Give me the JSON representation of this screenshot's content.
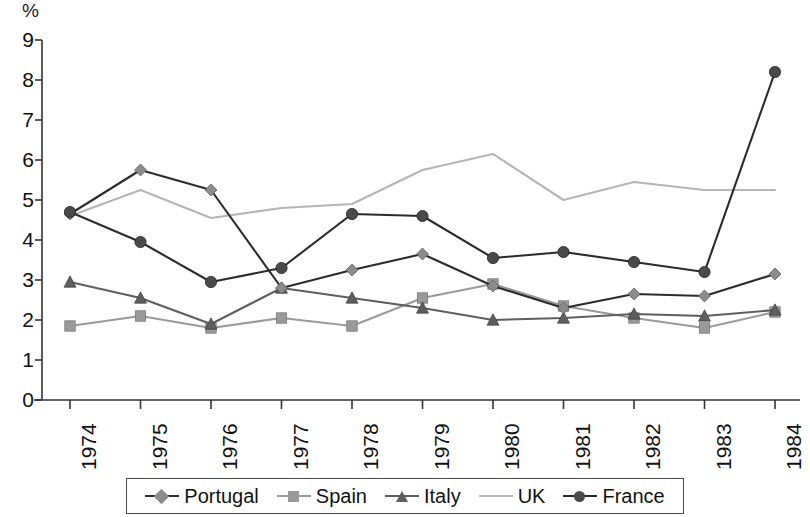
{
  "chart_data": {
    "type": "line",
    "title": "",
    "subtitle": "",
    "xlabel": "",
    "ylabel": "%",
    "unit_label": "%",
    "categories": [
      "1974",
      "1975",
      "1976",
      "1977",
      "1978",
      "1979",
      "1980",
      "1981",
      "1982",
      "1983",
      "1984"
    ],
    "x": [
      1974,
      1975,
      1976,
      1977,
      1978,
      1979,
      1980,
      1981,
      1982,
      1983,
      1984
    ],
    "ylim": [
      0,
      9
    ],
    "yticks": [
      0,
      1,
      2,
      3,
      4,
      5,
      6,
      7,
      8,
      9
    ],
    "ytick_labels": [
      "0",
      "1",
      "2",
      "3",
      "4",
      "5",
      "6",
      "7",
      "8",
      "9"
    ],
    "grid": false,
    "legend_position": "bottom",
    "series": [
      {
        "name": "Portugal",
        "marker": "diamond",
        "color": "#8c8c8c",
        "line_color": "#2b2b2b",
        "values": [
          4.65,
          5.75,
          5.25,
          2.8,
          3.25,
          3.65,
          2.85,
          2.3,
          2.65,
          2.6,
          3.15
        ]
      },
      {
        "name": "Spain",
        "marker": "square",
        "color": "#9a9a9a",
        "line_color": "#9a9a9a",
        "values": [
          1.85,
          2.1,
          1.8,
          2.05,
          1.85,
          2.55,
          2.9,
          2.35,
          2.05,
          1.8,
          2.2
        ]
      },
      {
        "name": "Italy",
        "marker": "triangle",
        "color": "#5e5e5e",
        "line_color": "#5e5e5e",
        "values": [
          2.95,
          2.55,
          1.9,
          2.8,
          2.55,
          2.3,
          2.0,
          2.05,
          2.15,
          2.1,
          2.25
        ]
      },
      {
        "name": "UK",
        "marker": "none",
        "color": "#b5b5b5",
        "line_color": "#b5b5b5",
        "values": [
          4.6,
          5.25,
          4.55,
          4.8,
          4.9,
          5.75,
          6.15,
          5.0,
          5.45,
          5.25,
          5.25
        ]
      },
      {
        "name": "France",
        "marker": "circle",
        "color": "#4a4a4a",
        "line_color": "#2b2b2b",
        "values": [
          4.7,
          3.95,
          2.95,
          3.3,
          4.65,
          4.6,
          3.55,
          3.7,
          3.45,
          3.2,
          8.2
        ]
      }
    ]
  },
  "legend": {
    "entries": [
      {
        "label": "Portugal"
      },
      {
        "label": "Spain"
      },
      {
        "label": "Italy"
      },
      {
        "label": "UK"
      },
      {
        "label": "France"
      }
    ]
  },
  "axis": {
    "color": "#333333"
  }
}
